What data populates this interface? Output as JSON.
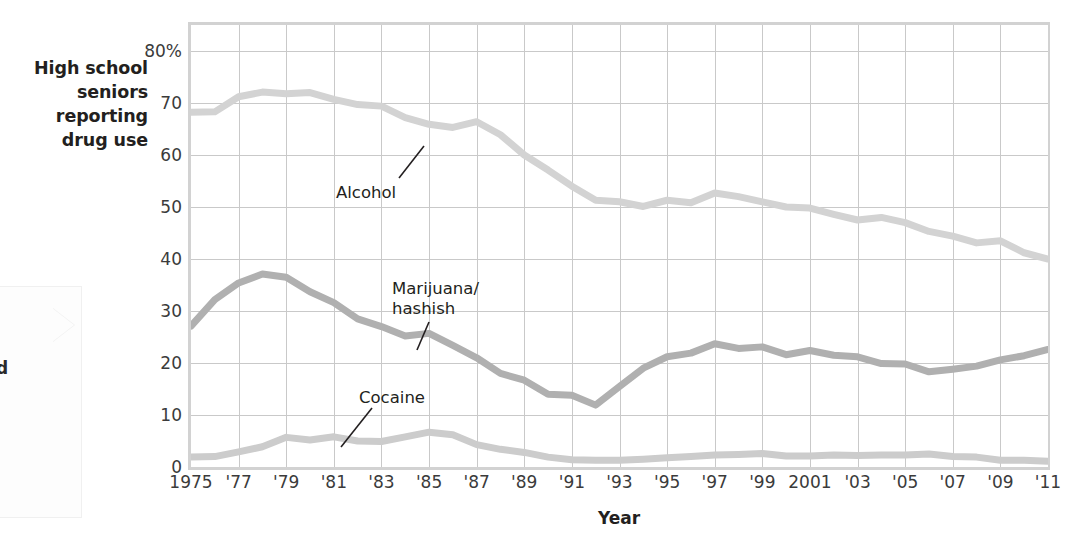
{
  "axes": {
    "y_title_lines": [
      "High school",
      "seniors",
      "reporting",
      "drug use"
    ],
    "y_ticks": [
      "80%",
      "70",
      "60",
      "50",
      "40",
      "30",
      "20",
      "10",
      "0"
    ],
    "y_tick_values": [
      80,
      70,
      60,
      50,
      40,
      30,
      20,
      10,
      0
    ],
    "x_title": "Year",
    "x_ticks": [
      "1975",
      "'77",
      "'79",
      "'81",
      "'83",
      "'85",
      "'87",
      "'89",
      "'91",
      "'93",
      "'95",
      "'97",
      "'99",
      "2001",
      "'03",
      "'05",
      "'07",
      "'09",
      "'11"
    ],
    "x_tick_values": [
      1975,
      1977,
      1979,
      1981,
      1983,
      1985,
      1987,
      1989,
      1991,
      1993,
      1995,
      1997,
      1999,
      2001,
      2003,
      2005,
      2007,
      2009,
      2011
    ]
  },
  "annotations": {
    "alcohol": "Alcohol",
    "marijuana": "Marijuana/\nhashish",
    "cocaine": "Cocaine"
  },
  "colors": {
    "alcohol_line": "#d3d3d3",
    "marijuana_line": "#b0b0b0",
    "cocaine_line": "#cccccc",
    "grid": "#c9c9c9",
    "frame": "#d2d2d2",
    "text": "#231f20",
    "tick_text": "#3b3b3b"
  },
  "chart_data": {
    "type": "line",
    "title": "",
    "subtitle": "",
    "xlabel": "Year",
    "ylabel": "High school seniors reporting drug use",
    "xlim": [
      1975,
      2011
    ],
    "ylim": [
      0,
      85
    ],
    "grid": true,
    "legend": "inline-annotations",
    "x": [
      1975,
      1976,
      1977,
      1978,
      1979,
      1980,
      1981,
      1982,
      1983,
      1984,
      1985,
      1986,
      1987,
      1988,
      1989,
      1990,
      1991,
      1992,
      1993,
      1994,
      1995,
      1996,
      1997,
      1998,
      1999,
      2000,
      2001,
      2002,
      2003,
      2004,
      2005,
      2006,
      2007,
      2008,
      2009,
      2010,
      2011
    ],
    "series": [
      {
        "name": "Alcohol",
        "color": "#d3d3d3",
        "values": [
          68.2,
          68.3,
          71.2,
          72.1,
          71.8,
          72.0,
          70.7,
          69.7,
          69.4,
          67.2,
          65.9,
          65.3,
          66.4,
          63.9,
          60.0,
          57.1,
          54.0,
          51.3,
          51.0,
          50.1,
          51.3,
          50.8,
          52.7,
          52.0,
          51.0,
          50.0,
          49.8,
          48.6,
          47.5,
          48.0,
          47.0,
          45.3,
          44.4,
          43.1,
          43.5,
          41.2,
          40.0
        ]
      },
      {
        "name": "Marijuana/hashish",
        "color": "#b0b0b0",
        "values": [
          27.1,
          32.2,
          35.4,
          37.1,
          36.5,
          33.7,
          31.6,
          28.5,
          27.0,
          25.2,
          25.7,
          23.4,
          21.0,
          18.0,
          16.7,
          14.0,
          13.8,
          11.9,
          15.5,
          19.0,
          21.2,
          21.9,
          23.7,
          22.8,
          23.1,
          21.6,
          22.4,
          21.5,
          21.2,
          19.9,
          19.8,
          18.3,
          18.8,
          19.4,
          20.6,
          21.4,
          22.6
        ]
      },
      {
        "name": "Cocaine",
        "color": "#cccccc",
        "values": [
          1.9,
          2.0,
          2.9,
          3.9,
          5.7,
          5.2,
          5.8,
          5.0,
          4.9,
          5.8,
          6.7,
          6.2,
          4.3,
          3.4,
          2.8,
          1.9,
          1.4,
          1.3,
          1.3,
          1.5,
          1.8,
          2.0,
          2.3,
          2.4,
          2.6,
          2.1,
          2.1,
          2.3,
          2.2,
          2.3,
          2.3,
          2.5,
          2.0,
          1.9,
          1.3,
          1.3,
          1.1
        ]
      }
    ]
  }
}
